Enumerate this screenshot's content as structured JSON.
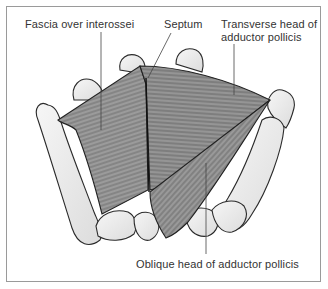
{
  "figure": {
    "type": "anatomical-diagram",
    "labels": {
      "fascia": "Fascia over interossei",
      "septum": "Septum",
      "transverse_line1": "Transverse head of",
      "transverse_line2": "adductor pollicis",
      "oblique": "Oblique head of adductor pollicis"
    },
    "colors": {
      "bone_fill": "#ececec",
      "bone_outline": "#2a2a2a",
      "muscle_fill": "#8c8c8c",
      "muscle_dark": "#6e6e6e",
      "frame_border": "#9a9a9a",
      "leader_line": "#444444",
      "text": "#333333"
    }
  }
}
